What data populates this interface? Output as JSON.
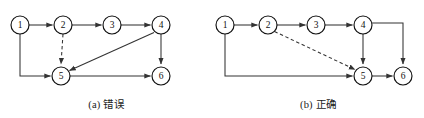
{
  "figure": {
    "panels": [
      {
        "id": "a",
        "caption": "(a) 错误",
        "nodes": [
          {
            "id": "1",
            "label": "1",
            "cx": 20,
            "cy": 25
          },
          {
            "id": "2",
            "label": "2",
            "cx": 63,
            "cy": 25
          },
          {
            "id": "3",
            "label": "3",
            "cx": 112,
            "cy": 25
          },
          {
            "id": "4",
            "label": "4",
            "cx": 161,
            "cy": 25
          },
          {
            "id": "5",
            "label": "5",
            "cx": 61,
            "cy": 76
          },
          {
            "id": "6",
            "label": "6",
            "cx": 161,
            "cy": 76
          }
        ],
        "edges": [
          {
            "from": "1",
            "to": "2",
            "style": "solid",
            "kind": "straight"
          },
          {
            "from": "2",
            "to": "3",
            "style": "solid",
            "kind": "straight"
          },
          {
            "from": "3",
            "to": "4",
            "style": "solid",
            "kind": "straight"
          },
          {
            "from": "2",
            "to": "5",
            "style": "dashed",
            "kind": "vertical"
          },
          {
            "from": "1",
            "to": "5",
            "style": "solid",
            "kind": "routed-left-down-right"
          },
          {
            "from": "4",
            "to": "5",
            "style": "solid",
            "kind": "diagonal"
          },
          {
            "from": "4",
            "to": "6",
            "style": "solid",
            "kind": "vertical"
          },
          {
            "from": "5",
            "to": "6",
            "style": "solid",
            "kind": "straight"
          }
        ]
      },
      {
        "id": "b",
        "caption": "(b) 正确",
        "nodes": [
          {
            "id": "1",
            "label": "1",
            "cx": 13,
            "cy": 25
          },
          {
            "id": "2",
            "label": "2",
            "cx": 56,
            "cy": 25
          },
          {
            "id": "3",
            "label": "3",
            "cx": 104,
            "cy": 25
          },
          {
            "id": "4",
            "label": "4",
            "cx": 151,
            "cy": 25
          },
          {
            "id": "5",
            "label": "5",
            "cx": 151,
            "cy": 76
          },
          {
            "id": "6",
            "label": "6",
            "cx": 191,
            "cy": 76
          }
        ],
        "edges": [
          {
            "from": "1",
            "to": "2",
            "style": "solid",
            "kind": "straight"
          },
          {
            "from": "2",
            "to": "3",
            "style": "solid",
            "kind": "straight"
          },
          {
            "from": "3",
            "to": "4",
            "style": "solid",
            "kind": "straight"
          },
          {
            "from": "2",
            "to": "5",
            "style": "dashed",
            "kind": "diagonal"
          },
          {
            "from": "1",
            "to": "5",
            "style": "solid",
            "kind": "routed-left-down-right"
          },
          {
            "from": "4",
            "to": "5",
            "style": "solid",
            "kind": "vertical"
          },
          {
            "from": "4",
            "to": "6",
            "style": "solid",
            "kind": "routed-right-down"
          },
          {
            "from": "5",
            "to": "6",
            "style": "solid",
            "kind": "straight"
          }
        ]
      }
    ],
    "node_radius": 9,
    "colors": {
      "stroke": "#333333",
      "node_stroke": "#111111",
      "node_fill": "#ffffff",
      "text": "#1a1a1a",
      "background": "#ffffff"
    }
  }
}
